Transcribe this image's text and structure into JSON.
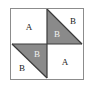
{
  "figure": {
    "kind": "geometric-diagram",
    "outer_square": {
      "border_color": "#8c8c8c",
      "fill_color": "#ffffff"
    },
    "shaded_fill": "#8a8a8a",
    "unshaded_fill": "#ffffff",
    "divider_color": "#3a3a3a",
    "quadrants": [
      {
        "name": "top-left",
        "fill": "unshaded",
        "label": "A"
      },
      {
        "name": "top-right",
        "fill": "split",
        "shaded_part": "lower-left-triangle",
        "shaded_label": "B",
        "unshaded_label": "B"
      },
      {
        "name": "bottom-left",
        "fill": "split",
        "shaded_part": "upper-right-triangle",
        "shaded_label": "B",
        "unshaded_label": "B"
      },
      {
        "name": "bottom-right",
        "fill": "unshaded",
        "label": "A"
      }
    ],
    "labels": {
      "top_left_a": "A",
      "top_right_gray_b": "B",
      "top_right_white_b": "B",
      "bottom_left_gray_b": "B",
      "bottom_left_white_b": "B",
      "bottom_right_a": "A"
    }
  }
}
